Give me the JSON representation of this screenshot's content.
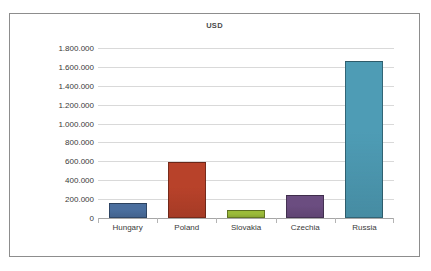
{
  "chart": {
    "title": "USD"
  },
  "chart_data": {
    "type": "bar",
    "title": "USD",
    "xlabel": "",
    "ylabel": "",
    "categories": [
      "Hungary",
      "Poland",
      "Slovakia",
      "Czechia",
      "Russia"
    ],
    "values": [
      160000,
      590000,
      90000,
      240000,
      1660000
    ],
    "bar_colors": [
      "#4a6e9e",
      "#b8422a",
      "#9bbb3a",
      "#6b4d80",
      "#4e9cb5"
    ],
    "ylim": [
      0,
      1800000
    ],
    "ytick_values": [
      0,
      200000,
      400000,
      600000,
      800000,
      1000000,
      1200000,
      1400000,
      1600000,
      1800000
    ],
    "ytick_labels": [
      "0",
      "200.000",
      "400.000",
      "600.000",
      "800.000",
      "1.000.000",
      "1.200.000",
      "1.400.000",
      "1.600.000",
      "1.800.000"
    ],
    "grid": true,
    "legend": false,
    "legend_position": "none",
    "number_format": "dot-thousands-separator"
  }
}
